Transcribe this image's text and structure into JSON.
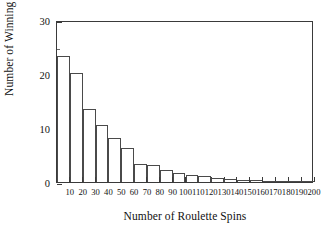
{
  "chart_data": {
    "type": "bar",
    "title": "",
    "xlabel": "Number of Roulette Spins",
    "ylabel": "Number of Winning Players",
    "categories": [
      "10",
      "20",
      "30",
      "40",
      "50",
      "60",
      "70",
      "80",
      "90",
      "100",
      "110",
      "120",
      "130",
      "140",
      "150",
      "160",
      "170",
      "180",
      "190",
      "200"
    ],
    "values": [
      23.3,
      20.2,
      13.5,
      10.5,
      8.2,
      6.3,
      3.4,
      3.1,
      2.2,
      1.6,
      1.3,
      1.1,
      0.8,
      0.6,
      0.4,
      0.3,
      0.25,
      0.2,
      0.15,
      0.1
    ],
    "xtick_labels": [
      "10",
      "20",
      "30",
      "40",
      "50",
      "60",
      "70",
      "80",
      "90",
      "100",
      "110",
      "120",
      "130",
      "140",
      "150",
      "160",
      "170",
      "180",
      "190",
      "200"
    ],
    "ytick_labels": [
      "0",
      "10",
      "20",
      "30"
    ],
    "ytick_values": [
      0,
      10,
      20,
      30
    ],
    "yminor_values": [
      5,
      15,
      25
    ],
    "ylim": [
      0,
      30
    ],
    "xlim": [
      0,
      200
    ],
    "grid": false,
    "legend": null,
    "bar_fill": "#ffffff",
    "bar_edge": "#4a4a4a",
    "axis_color": "#3a3a3a",
    "background": "#ffffff"
  }
}
